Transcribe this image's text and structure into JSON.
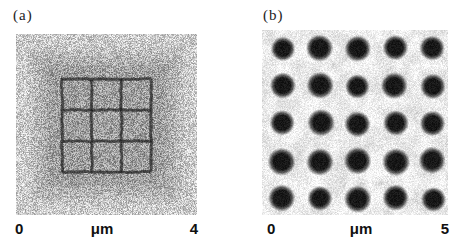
{
  "figure": {
    "panels": [
      {
        "label": "(a)",
        "scale": {
          "start": "0",
          "unit": "μm",
          "end": "4"
        },
        "image": {
          "kind": "noisy-micrograph-with-etched-grid",
          "grid_rows": 3,
          "grid_cols": 3,
          "outer_background_color": "#cbcbcb",
          "center_background_color": "#9e9e9e",
          "grid_line_color": "#262626"
        }
      },
      {
        "label": "(b)",
        "scale": {
          "start": "0",
          "unit": "μm",
          "end": "5"
        },
        "image": {
          "kind": "noisy-micrograph-dot-array",
          "dot_rows": 5,
          "dot_cols": 5,
          "background_color": "#e4e4e4",
          "dot_color": "#161616"
        }
      }
    ]
  }
}
